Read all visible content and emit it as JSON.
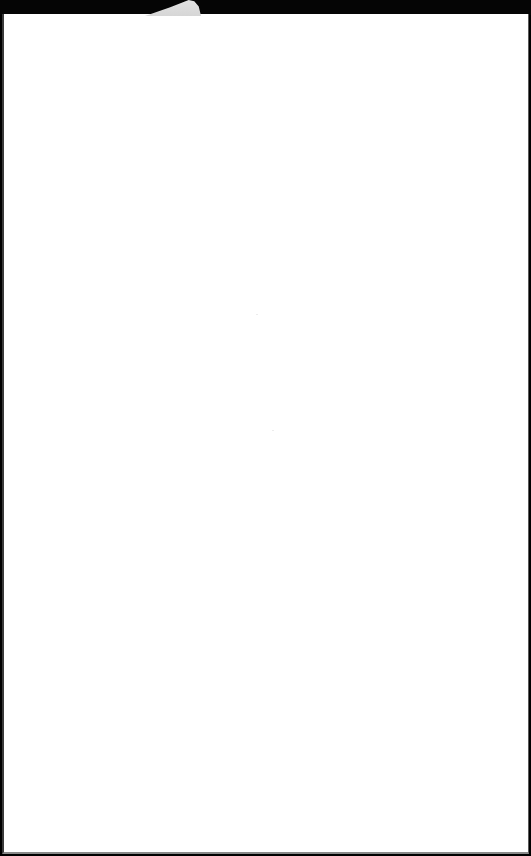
{
  "document": {
    "content": "",
    "background_color": "#ffffff",
    "frame_color": "#050505",
    "tab_color": "#dedede"
  }
}
